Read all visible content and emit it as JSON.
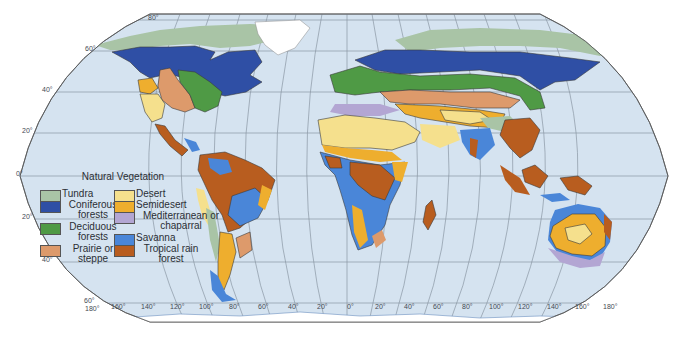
{
  "map": {
    "title": "Natural Vegetation",
    "projection": "Robinson",
    "ocean_color": "#d5e3f0",
    "land_outline_color": "#3a3a3a",
    "latitude_labels": [
      {
        "text": "80°",
        "x": 148,
        "y": 20
      },
      {
        "text": "60°",
        "x": 85,
        "y": 51
      },
      {
        "text": "40°",
        "x": 42,
        "y": 92
      },
      {
        "text": "20°",
        "x": 22,
        "y": 133
      },
      {
        "text": "0°",
        "x": 16,
        "y": 176
      },
      {
        "text": "20°",
        "x": 22,
        "y": 219
      },
      {
        "text": "40°",
        "x": 42,
        "y": 262
      },
      {
        "text": "60°",
        "x": 84,
        "y": 303
      }
    ],
    "longitude_labels": [
      {
        "text": "180°",
        "x": 85,
        "y": 311
      },
      {
        "text": "160°",
        "x": 111,
        "y": 309
      },
      {
        "text": "140°",
        "x": 141,
        "y": 309
      },
      {
        "text": "120°",
        "x": 170,
        "y": 309
      },
      {
        "text": "100°",
        "x": 199,
        "y": 309
      },
      {
        "text": "80°",
        "x": 229,
        "y": 309
      },
      {
        "text": "60°",
        "x": 258,
        "y": 309
      },
      {
        "text": "40°",
        "x": 288,
        "y": 309
      },
      {
        "text": "20°",
        "x": 317,
        "y": 309
      },
      {
        "text": "0°",
        "x": 347,
        "y": 309
      },
      {
        "text": "20°",
        "x": 375,
        "y": 309
      },
      {
        "text": "40°",
        "x": 404,
        "y": 309
      },
      {
        "text": "60°",
        "x": 433,
        "y": 309
      },
      {
        "text": "80°",
        "x": 462,
        "y": 309
      },
      {
        "text": "100°",
        "x": 489,
        "y": 309
      },
      {
        "text": "120°",
        "x": 518,
        "y": 309
      },
      {
        "text": "140°",
        "x": 547,
        "y": 309
      },
      {
        "text": "160°",
        "x": 575,
        "y": 309
      },
      {
        "text": "180°",
        "x": 603,
        "y": 309
      }
    ]
  },
  "legend": {
    "title": "Natural Vegetation",
    "items": [
      {
        "label": "Tundra",
        "color": "#a9c4a6"
      },
      {
        "label": "Coniferous forests",
        "color": "#2f4fa5"
      },
      {
        "label": "Deciduous forests",
        "color": "#4f9a45"
      },
      {
        "label": "Prairie or steppe",
        "color": "#dd9a6b"
      },
      {
        "label": "Desert",
        "color": "#f5e08d"
      },
      {
        "label": "Semidesert",
        "color": "#eeae2e"
      },
      {
        "label": "Mediterranean or chaparral",
        "color": "#b3a6d3"
      },
      {
        "label": "Savanna",
        "color": "#4a86d8"
      },
      {
        "label": "Tropical rain forest",
        "color": "#b85d1f"
      }
    ]
  }
}
